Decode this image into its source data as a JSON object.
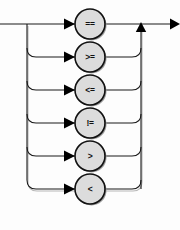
{
  "diagram": {
    "type": "railroad-syntax-diagram",
    "background_color": "#fdfdfd",
    "line_color": "#1a1a1a",
    "node_fill_color": "#dcdcdc",
    "node_stroke_color": "#111111",
    "shadow_color": "#9a9a9a",
    "geometry": {
      "width": 180,
      "height": 230,
      "entry_x": 0,
      "exit_x": 180,
      "main_line_y": 24,
      "left_rail_x": 27,
      "right_rail_x": 141,
      "node_center_x": 90,
      "node_radius": 15,
      "row_spacing": 33,
      "corner_radius": 9
    },
    "branches": [
      {
        "label": "==",
        "name": "equal-to",
        "row": 0,
        "y": 24
      },
      {
        "label": ">=",
        "name": "greater-than-or-equal-to",
        "row": 1,
        "y": 57
      },
      {
        "label": "<=",
        "name": "less-than-or-equal-to",
        "row": 2,
        "y": 90
      },
      {
        "label": "!=",
        "name": "not-equal-to",
        "row": 3,
        "y": 123
      },
      {
        "label": ">",
        "name": "greater-than",
        "row": 4,
        "y": 156
      },
      {
        "label": "<",
        "name": "less-than",
        "row": 5,
        "y": 189
      }
    ]
  }
}
